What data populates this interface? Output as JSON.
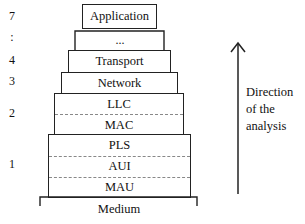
{
  "layer_numbers": [
    "7",
    ":",
    "4",
    "3",
    "2",
    "1"
  ],
  "layers": {
    "application": "Application",
    "ellipsis": "...",
    "transport": "Transport",
    "network": "Network",
    "llc": "LLC",
    "mac": "MAC",
    "pls": "PLS",
    "aui": "AUI",
    "mau": "MAU",
    "medium": "Medium"
  },
  "arrow_label": [
    "Direction",
    "of the",
    "analysis"
  ]
}
